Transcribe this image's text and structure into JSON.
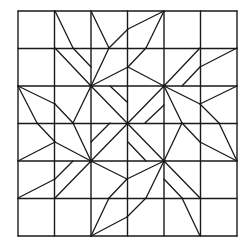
{
  "diagram": {
    "stroke_color": "#1a1a1a",
    "background": "#ffffff",
    "grid": {
      "x0": 18,
      "y0": 11,
      "x1": 237,
      "y1": 236,
      "cols": 6,
      "rows": 6
    },
    "hubs": [
      [
        91,
        86
      ],
      [
        164,
        86
      ],
      [
        91,
        161
      ],
      [
        164,
        161
      ],
      [
        127.5,
        123.5
      ]
    ],
    "lines": [
      [
        55,
        11,
        73,
        48
      ],
      [
        73,
        48,
        91,
        67
      ],
      [
        55,
        48,
        91,
        86
      ],
      [
        91,
        11,
        109,
        48
      ],
      [
        109,
        48,
        128,
        29
      ],
      [
        128,
        29,
        164,
        11
      ],
      [
        109,
        48,
        91,
        86
      ],
      [
        164,
        11,
        146,
        48
      ],
      [
        146,
        48,
        128,
        67
      ],
      [
        91,
        86,
        128,
        67
      ],
      [
        128,
        67,
        164,
        86
      ],
      [
        164,
        86,
        200,
        48
      ],
      [
        182,
        86,
        200,
        67
      ],
      [
        200,
        67,
        237,
        48
      ],
      [
        164,
        86,
        200,
        104
      ],
      [
        200,
        104,
        237,
        86
      ],
      [
        200,
        104,
        219,
        123
      ],
      [
        219,
        123,
        237,
        161
      ],
      [
        164,
        86,
        182,
        123
      ],
      [
        182,
        123,
        200,
        142
      ],
      [
        200,
        142,
        237,
        161
      ],
      [
        182,
        123,
        164,
        161
      ],
      [
        18,
        86,
        55,
        104
      ],
      [
        55,
        104,
        73,
        123
      ],
      [
        18,
        86,
        37,
        123
      ],
      [
        37,
        123,
        55,
        142
      ],
      [
        55,
        142,
        91,
        161
      ],
      [
        91,
        86,
        73,
        123
      ],
      [
        73,
        123,
        91,
        161
      ],
      [
        18,
        161,
        55,
        142
      ],
      [
        91,
        161,
        127,
        179
      ],
      [
        127,
        179,
        164,
        161
      ],
      [
        164,
        161,
        146,
        198
      ],
      [
        146,
        198,
        127,
        217
      ],
      [
        127,
        217,
        91,
        236
      ],
      [
        127,
        179,
        109,
        198
      ],
      [
        109,
        198,
        91,
        236
      ],
      [
        164,
        179,
        182,
        198
      ],
      [
        182,
        198,
        200,
        236
      ],
      [
        164,
        161,
        200,
        198
      ],
      [
        18,
        198,
        55,
        179
      ],
      [
        55,
        179,
        73,
        161
      ],
      [
        55,
        198,
        91,
        161
      ],
      [
        91,
        86,
        164,
        161
      ],
      [
        164,
        86,
        91,
        161
      ],
      [
        110,
        86,
        127,
        102
      ],
      [
        145,
        123,
        164,
        105
      ],
      [
        91,
        142,
        110,
        123
      ],
      [
        128,
        142,
        146,
        161
      ]
    ]
  }
}
